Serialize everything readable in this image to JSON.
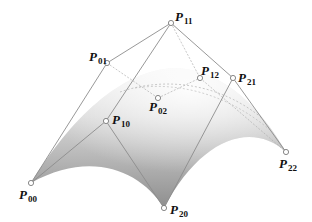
{
  "diagram": {
    "type": "bezier-surface-control-net",
    "colors": {
      "background": "#ffffff",
      "surface_light": "#f2f2f2",
      "surface_dark": "#8a8a8a",
      "net_line": "#8c8c8c",
      "hidden_line": "#b0b0b0",
      "point_fill": "#ffffff",
      "point_stroke": "#7a7a7a",
      "label": "#111111"
    },
    "points": [
      {
        "id": "P00",
        "letter": "P",
        "sub": "00",
        "x": 31,
        "y": 183,
        "lx": 19,
        "ly": 188
      },
      {
        "id": "P01",
        "letter": "P",
        "sub": "01",
        "x": 107,
        "y": 63,
        "lx": 89,
        "ly": 50
      },
      {
        "id": "P02",
        "letter": "P",
        "sub": "02",
        "x": 158,
        "y": 98,
        "lx": 149,
        "ly": 100
      },
      {
        "id": "P10",
        "letter": "P",
        "sub": "10",
        "x": 106,
        "y": 121,
        "lx": 112,
        "ly": 113
      },
      {
        "id": "P11",
        "letter": "P",
        "sub": "11",
        "x": 171,
        "y": 23,
        "lx": 175,
        "ly": 10
      },
      {
        "id": "P12",
        "letter": "P",
        "sub": "12",
        "x": 200,
        "y": 78,
        "lx": 201,
        "ly": 64
      },
      {
        "id": "P20",
        "letter": "P",
        "sub": "20",
        "x": 164,
        "y": 208,
        "lx": 170,
        "ly": 203
      },
      {
        "id": "P21",
        "letter": "P",
        "sub": "21",
        "x": 233,
        "y": 78,
        "lx": 238,
        "ly": 71
      },
      {
        "id": "P22",
        "letter": "P",
        "sub": "22",
        "x": 286,
        "y": 152,
        "lx": 279,
        "ly": 157
      }
    ],
    "edges_visible": [
      [
        "P00",
        "P01"
      ],
      [
        "P01",
        "P11"
      ],
      [
        "P11",
        "P21"
      ],
      [
        "P21",
        "P22"
      ],
      [
        "P00",
        "P10"
      ],
      [
        "P10",
        "P20"
      ],
      [
        "P20",
        "P21"
      ],
      [
        "P10",
        "P11"
      ]
    ],
    "edges_hidden": [
      [
        "P01",
        "P02"
      ],
      [
        "P02",
        "P12"
      ],
      [
        "P12",
        "P22"
      ],
      [
        "P11",
        "P12"
      ]
    ]
  }
}
